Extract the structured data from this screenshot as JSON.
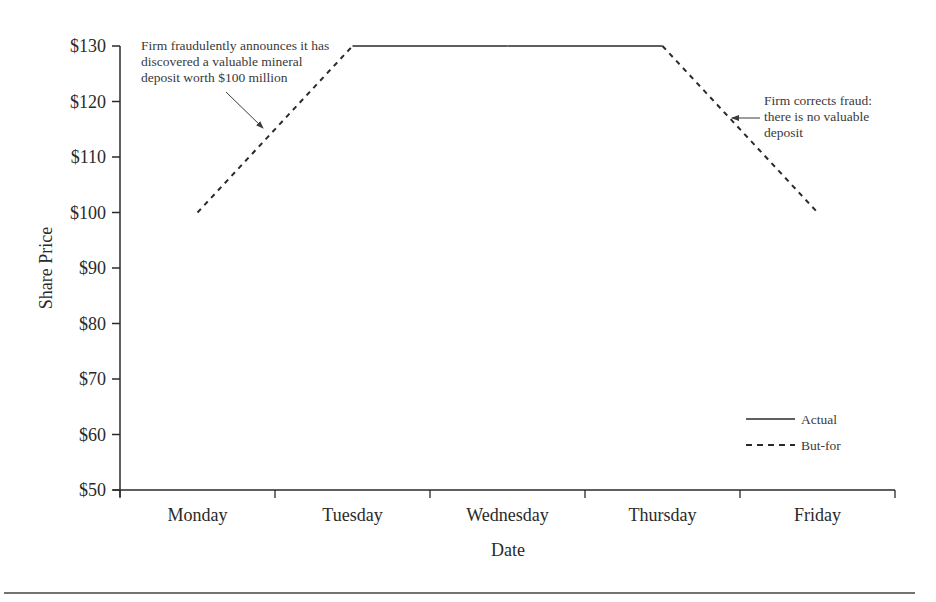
{
  "chart_data": {
    "type": "line",
    "title": "",
    "xlabel": "Date",
    "ylabel": "Share Price",
    "categories": [
      "Monday",
      "Tuesday",
      "Wednesday",
      "Thursday",
      "Friday"
    ],
    "y_ticks": [
      "$50",
      "$60",
      "$70",
      "$80",
      "$90",
      "$100",
      "$110",
      "$120",
      "$130"
    ],
    "y_tick_values": [
      50,
      60,
      70,
      80,
      90,
      100,
      110,
      120,
      130
    ],
    "ylim": [
      50,
      130
    ],
    "grid": false,
    "legend_position": "lower right",
    "series": [
      {
        "name": "Actual",
        "style": "solid",
        "values": [
          null,
          130,
          130,
          130,
          null
        ]
      },
      {
        "name": "But-for",
        "style": "dashed",
        "values": [
          100,
          130,
          null,
          130,
          100
        ]
      }
    ],
    "annotations": [
      {
        "id": "fraud-announcement",
        "lines": [
          "Firm fraudulently announces it has",
          "discovered a valuable mineral",
          "deposit worth $100 million"
        ],
        "points_to": "But-for line between Monday and Tuesday"
      },
      {
        "id": "fraud-correction",
        "lines": [
          "Firm corrects fraud:",
          "there is no valuable",
          "deposit"
        ],
        "points_to": "But-for line between Thursday and Friday"
      }
    ]
  },
  "colors": {
    "ink": "#2a2a2a",
    "background": "#ffffff"
  }
}
